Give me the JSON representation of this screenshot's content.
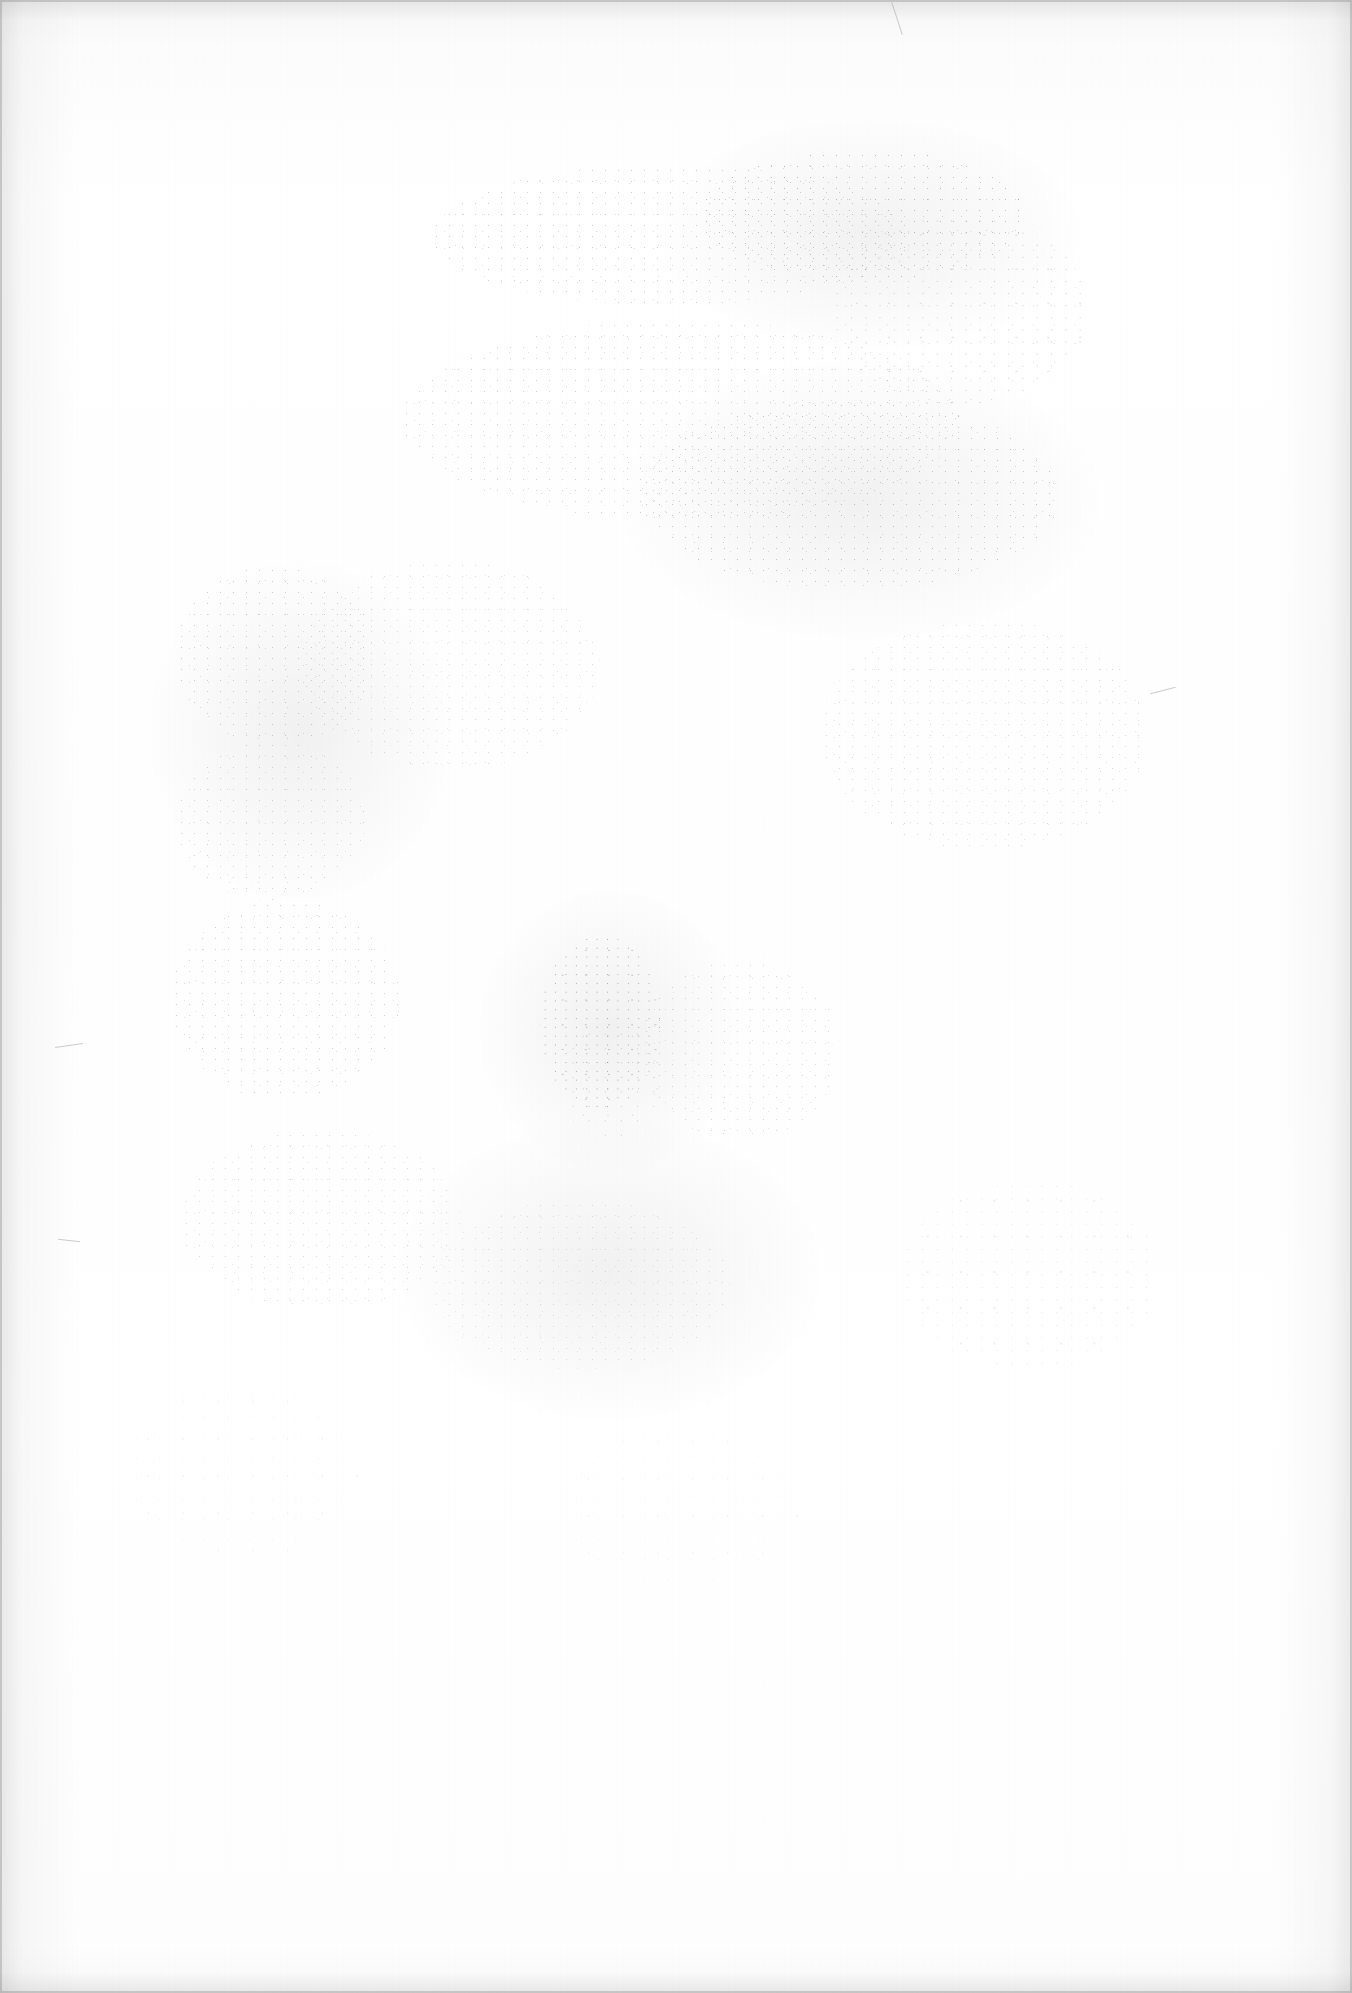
{
  "document": {
    "page_kind": "scanned-blank-page",
    "description": "Scanned page containing no printed text or figures; only paper texture, toner speckle and scanner edge shadow are visible.",
    "visible_text": "",
    "page_number_shown": "",
    "header_text": "",
    "footer_text": "",
    "body_text": ""
  },
  "appearance": {
    "page_background_hex": "#fefefe",
    "paper_tone_hex": "#ffffff",
    "edge_shadow_hex": "#8c8c8c",
    "speckle_hex": "#5a5a5f",
    "smudge_hex": "#787880"
  },
  "canvas": {
    "width": 1352,
    "height": 1993
  },
  "marks": {
    "speckle_clusters": [
      {
        "name": "upper-center-band",
        "x": 430,
        "y": 165,
        "w": 480,
        "h": 140,
        "opacity": 0.55,
        "scale": 1.0
      },
      {
        "name": "upper-right-band",
        "x": 700,
        "y": 150,
        "w": 330,
        "h": 130,
        "opacity": 0.7,
        "scale": 1.0
      },
      {
        "name": "upper-right-edge",
        "x": 830,
        "y": 215,
        "w": 260,
        "h": 190,
        "opacity": 0.6,
        "scale": 1.1
      },
      {
        "name": "mid-center-band",
        "x": 400,
        "y": 320,
        "w": 560,
        "h": 200,
        "opacity": 0.5,
        "scale": 1.0
      },
      {
        "name": "mid-right-band",
        "x": 640,
        "y": 400,
        "w": 420,
        "h": 190,
        "opacity": 0.62,
        "scale": 1.0
      },
      {
        "name": "left-column-upper",
        "x": 175,
        "y": 565,
        "w": 200,
        "h": 180,
        "opacity": 0.55,
        "scale": 1.0
      },
      {
        "name": "left-column-lower",
        "x": 175,
        "y": 740,
        "w": 190,
        "h": 160,
        "opacity": 0.48,
        "scale": 1.0
      },
      {
        "name": "center-left-mid",
        "x": 300,
        "y": 560,
        "w": 300,
        "h": 210,
        "opacity": 0.4,
        "scale": 1.0
      },
      {
        "name": "right-mid-band",
        "x": 820,
        "y": 620,
        "w": 330,
        "h": 230,
        "opacity": 0.42,
        "scale": 1.0
      },
      {
        "name": "left-lower-block",
        "x": 170,
        "y": 900,
        "w": 230,
        "h": 200,
        "opacity": 0.5,
        "scale": 1.0
      },
      {
        "name": "center-dense-smudge",
        "x": 540,
        "y": 935,
        "w": 120,
        "h": 175,
        "opacity": 0.95,
        "scale": 0.8
      },
      {
        "name": "center-dense-tail",
        "x": 560,
        "y": 1020,
        "w": 100,
        "h": 120,
        "opacity": 0.8,
        "scale": 0.85
      },
      {
        "name": "center-right-low",
        "x": 640,
        "y": 960,
        "w": 200,
        "h": 180,
        "opacity": 0.45,
        "scale": 1.0
      },
      {
        "name": "lower-left-band",
        "x": 180,
        "y": 1130,
        "w": 280,
        "h": 180,
        "opacity": 0.42,
        "scale": 1.0
      },
      {
        "name": "lower-center-band",
        "x": 430,
        "y": 1200,
        "w": 300,
        "h": 170,
        "opacity": 0.35,
        "scale": 1.0
      },
      {
        "name": "lower-right-sparse",
        "x": 900,
        "y": 1180,
        "w": 260,
        "h": 190,
        "opacity": 0.28,
        "scale": 1.15
      },
      {
        "name": "bottom-left-sparse",
        "x": 120,
        "y": 1380,
        "w": 240,
        "h": 180,
        "opacity": 0.25,
        "scale": 1.2
      },
      {
        "name": "bottom-center",
        "x": 560,
        "y": 1420,
        "w": 240,
        "h": 170,
        "opacity": 0.22,
        "scale": 1.2
      }
    ],
    "smudges": [
      {
        "name": "upper-right-haze",
        "x": 660,
        "y": 120,
        "w": 420,
        "h": 230
      },
      {
        "name": "mid-right-haze",
        "x": 620,
        "y": 360,
        "w": 480,
        "h": 280
      },
      {
        "name": "center-core-haze",
        "x": 480,
        "y": 890,
        "w": 260,
        "h": 280
      },
      {
        "name": "left-mid-haze",
        "x": 150,
        "y": 560,
        "w": 300,
        "h": 340
      },
      {
        "name": "lower-center-haze",
        "x": 400,
        "y": 1120,
        "w": 420,
        "h": 300
      }
    ],
    "scratches": [
      {
        "name": "left-edge-hair",
        "x": 55,
        "y": 1045,
        "w": 28,
        "rotate": -8
      },
      {
        "name": "left-edge-hair-2",
        "x": 58,
        "y": 1240,
        "w": 22,
        "rotate": 6
      },
      {
        "name": "top-right-hair",
        "x": 880,
        "y": 18,
        "w": 34,
        "rotate": 72
      },
      {
        "name": "mid-right-hair",
        "x": 1150,
        "y": 690,
        "w": 26,
        "rotate": -14
      }
    ]
  }
}
